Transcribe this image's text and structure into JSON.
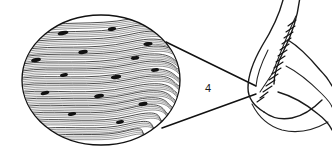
{
  "figure": {
    "label": "4",
    "label_x": 208,
    "label_y": 92,
    "colors": {
      "background": "#ffffff",
      "ink": "#1a1a1a",
      "nucleus": "#111111"
    },
    "inset": {
      "name": "muscle-tissue-magnification",
      "shape": "ellipse",
      "cx": 101,
      "cy": 80,
      "rx": 79,
      "ry": 65,
      "description": "Longitudinal section of skeletal muscle fibers with peripheral nuclei",
      "fiber_count": 34,
      "nuclei_count": 14
    },
    "anatomy": {
      "name": "flexed-arm",
      "description": "Outline of a flexed arm showing the biceps brachii muscle at the elbow",
      "structure_labeled": "skeletal muscle"
    },
    "leader_lines": [
      {
        "name": "upper-leader-line",
        "x1": 166,
        "y1": 42,
        "x2": 256,
        "y2": 86
      },
      {
        "name": "lower-leader-line",
        "x1": 162,
        "y1": 128,
        "x2": 256,
        "y2": 94
      }
    ],
    "fibers": [
      {
        "d": "M 30 28 C 60 20, 95 26, 130 19 S 168 24, 176 30",
        "w": 0.9
      },
      {
        "d": "M 26 36 C 58 28, 92 35, 128 27 S 170 32, 179 38",
        "w": 0.6
      },
      {
        "d": "M 24 43 C 56 36, 94 43, 132 34 S 172 40, 180 45",
        "w": 0.85
      },
      {
        "d": "M 23 50 C 55 44, 90 51, 130 42 S 173 47, 181 52",
        "w": 0.55
      },
      {
        "d": "M 22 57 C 54 51, 92 58, 134 49 S 174 54, 181 58",
        "w": 0.9
      },
      {
        "d": "M 22 64 C 52 59, 88 66, 130 57 S 173 61, 181 65",
        "w": 0.6
      },
      {
        "d": "M 22 71 C 52 66, 90 73, 132 64 S 174 68, 181 72",
        "w": 0.85
      },
      {
        "d": "M 22 78 C 50 74, 88 81, 130 72 S 173 76, 180 79",
        "w": 0.55
      },
      {
        "d": "M 23 85 C 52 81, 90 88, 132 79 S 172 83, 179 86",
        "w": 0.9
      },
      {
        "d": "M 24 92 C 52 89, 88 96, 130 87 S 171 90, 177 93",
        "w": 0.6
      },
      {
        "d": "M 26 99 C 54 96, 90 103, 130 94 S 169 97, 175 100",
        "w": 0.85
      },
      {
        "d": "M 29 106 C 56 103, 92 110, 130 101 S 166 104, 172 107",
        "w": 0.55
      },
      {
        "d": "M 33 113 C 60 110, 94 117, 130 108 S 162 111, 168 114",
        "w": 0.9
      },
      {
        "d": "M 39 120 C 64 118, 96 124, 130 116 S 157 118, 162 121",
        "w": 0.6
      },
      {
        "d": "M 47 128 C 70 126, 100 131, 128 124 S 150 126, 154 128",
        "w": 0.8
      },
      {
        "d": "M 58 135 C 78 133, 104 137, 126 131 S 140 133, 144 134",
        "w": 0.55
      }
    ],
    "nuclei": [
      {
        "cx": 63,
        "cy": 33,
        "rx": 5.5,
        "ry": 2.1,
        "rot": -11
      },
      {
        "cx": 112,
        "cy": 29,
        "rx": 4.2,
        "ry": 1.9,
        "rot": -9
      },
      {
        "cx": 148,
        "cy": 44,
        "rx": 4.6,
        "ry": 1.9,
        "rot": -7
      },
      {
        "cx": 36,
        "cy": 60,
        "rx": 5.0,
        "ry": 2.0,
        "rot": -13
      },
      {
        "cx": 83,
        "cy": 52,
        "rx": 4.8,
        "ry": 2.0,
        "rot": -10
      },
      {
        "cx": 135,
        "cy": 58,
        "rx": 4.3,
        "ry": 1.8,
        "rot": -8
      },
      {
        "cx": 64,
        "cy": 75,
        "rx": 4.0,
        "ry": 1.8,
        "rot": -10
      },
      {
        "cx": 116,
        "cy": 77,
        "rx": 5.2,
        "ry": 2.1,
        "rot": -9
      },
      {
        "cx": 155,
        "cy": 70,
        "rx": 4.0,
        "ry": 1.8,
        "rot": -8
      },
      {
        "cx": 45,
        "cy": 93,
        "rx": 4.4,
        "ry": 1.9,
        "rot": -12
      },
      {
        "cx": 99,
        "cy": 96,
        "rx": 5.0,
        "ry": 2.0,
        "rot": -10
      },
      {
        "cx": 143,
        "cy": 104,
        "rx": 4.6,
        "ry": 2.0,
        "rot": -9
      },
      {
        "cx": 72,
        "cy": 114,
        "rx": 4.2,
        "ry": 1.8,
        "rot": -11
      },
      {
        "cx": 120,
        "cy": 122,
        "rx": 4.0,
        "ry": 1.8,
        "rot": -9
      }
    ],
    "arm_paths": [
      {
        "name": "upper-arm-posterior",
        "d": "M 284 -4 C 280 14, 272 30, 262 46 C 254 60, 248 74, 248 88 C 248 98, 254 106, 264 112",
        "w": 1.4
      },
      {
        "name": "upper-arm-anterior",
        "d": "M 300 -4 C 298 16, 292 34, 284 50 C 278 62, 274 74, 274 84",
        "w": 1.2
      },
      {
        "name": "elbow-crease",
        "d": "M 264 112 C 272 118, 282 120, 292 118 C 302 116, 312 110, 322 100",
        "w": 1.4
      },
      {
        "name": "forearm-superior",
        "d": "M 288 40 C 298 46, 310 58, 320 70 C 326 76, 330 82, 332 86",
        "w": 1.3
      },
      {
        "name": "forearm-inferior",
        "d": "M 278 92 C 292 96, 306 104, 318 114 C 326 120, 330 126, 332 130",
        "w": 1.3
      },
      {
        "name": "forearm-mid",
        "d": "M 286 66 C 298 72, 310 82, 322 94 C 328 100, 331 104, 332 107",
        "w": 1.0
      },
      {
        "name": "elbow-fold-lower",
        "d": "M 252 104 C 258 116, 268 126, 282 130 C 298 134, 314 130, 328 122",
        "w": 1.1
      },
      {
        "name": "biceps-belly-upper",
        "d": "M 296 16 C 292 24, 288 34, 284 44 C 280 54, 276 64, 272 74",
        "w": 1.0
      },
      {
        "name": "biceps-tendon",
        "d": "M 272 74 C 268 80, 264 86, 260 92",
        "w": 1.0
      },
      {
        "name": "arm-edge-inner",
        "d": "M 268 50 C 262 62, 257 74, 256 86",
        "w": 0.9
      }
    ],
    "striations": [
      {
        "d": "M 296 20 L 288 26",
        "w": 1.2
      },
      {
        "d": "M 295 26 L 286 32",
        "w": 1.2
      },
      {
        "d": "M 293 32 L 284 38",
        "w": 1.2
      },
      {
        "d": "M 291 38 L 282 44",
        "w": 1.2
      },
      {
        "d": "M 289 44 L 280 50",
        "w": 1.2
      },
      {
        "d": "M 287 50 L 278 56",
        "w": 1.2
      },
      {
        "d": "M 285 56 L 276 62",
        "w": 1.2
      },
      {
        "d": "M 283 62 L 274 68",
        "w": 1.2
      },
      {
        "d": "M 281 68 L 272 74",
        "w": 1.2
      },
      {
        "d": "M 278 74 L 269 80",
        "w": 1.1
      },
      {
        "d": "M 275 80 L 266 86",
        "w": 1.1
      },
      {
        "d": "M 272 86 L 263 92",
        "w": 1.1
      },
      {
        "d": "M 268 92 L 260 98",
        "w": 1.0
      },
      {
        "d": "M 264 97 L 257 102",
        "w": 1.0
      }
    ]
  }
}
